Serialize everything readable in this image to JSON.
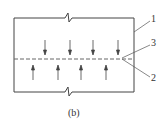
{
  "figure": {
    "caption": "(b)",
    "labels": [
      {
        "id": "1",
        "text": "1",
        "x": 150,
        "y": 16
      },
      {
        "id": "3",
        "text": "3",
        "x": 150,
        "y": 39
      },
      {
        "id": "2",
        "text": "2",
        "x": 150,
        "y": 73
      }
    ],
    "down_arrows_x": [
      45,
      70,
      93,
      118
    ],
    "up_arrows_x": [
      33,
      58,
      81,
      106
    ],
    "colors": {
      "line": "#444444",
      "dash": "#666666"
    }
  }
}
